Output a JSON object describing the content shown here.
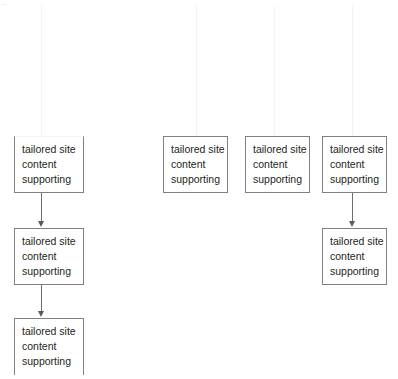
{
  "diagram": {
    "background_color": "#ffffff",
    "box_border_color": "#808080",
    "connector_color": "#6e6e6e",
    "text_color": "#231f20",
    "guide_line_color": "#f2f3f5",
    "corner_mark": "..",
    "node_text": {
      "line1": "tailored site",
      "line2": "content",
      "line3": "supporting"
    },
    "columns": [
      {
        "id": "column-1",
        "guide_x": 41,
        "nodes": [
          {
            "id": "node-1-1",
            "x": 14,
            "y": 136,
            "w": 70,
            "h": 57,
            "clip": "top"
          },
          {
            "id": "node-1-2",
            "x": 14,
            "y": 228,
            "w": 70,
            "h": 57,
            "clip": "none"
          },
          {
            "id": "node-1-3",
            "x": 14,
            "y": 318,
            "w": 70,
            "h": 57,
            "clip": "bottom"
          }
        ],
        "connectors": [
          {
            "id": "connector-1-1",
            "x": 41,
            "y": 193,
            "length": 35
          },
          {
            "id": "connector-1-2",
            "x": 41,
            "y": 285,
            "length": 33
          }
        ]
      },
      {
        "id": "column-2",
        "guide_x": 196,
        "nodes": [
          {
            "id": "node-2-1",
            "x": 163,
            "y": 136,
            "w": 65,
            "h": 57,
            "clip": "none"
          }
        ],
        "connectors": []
      },
      {
        "id": "column-3",
        "guide_x": 274,
        "nodes": [
          {
            "id": "node-3-1",
            "x": 245,
            "y": 136,
            "w": 65,
            "h": 57,
            "clip": "none"
          }
        ],
        "connectors": []
      },
      {
        "id": "column-4",
        "guide_x": 352,
        "nodes": [
          {
            "id": "node-4-1",
            "x": 322,
            "y": 136,
            "w": 65,
            "h": 57,
            "clip": "none"
          },
          {
            "id": "node-4-2",
            "x": 322,
            "y": 228,
            "w": 65,
            "h": 57,
            "clip": "none"
          }
        ],
        "connectors": [
          {
            "id": "connector-4-1",
            "x": 352,
            "y": 193,
            "length": 35
          }
        ]
      }
    ]
  }
}
